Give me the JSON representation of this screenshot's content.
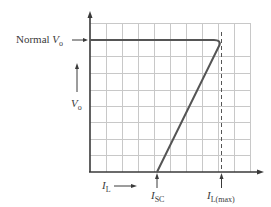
{
  "diagram": {
    "labels": {
      "normal_vo_prefix": "Normal ",
      "vo_symbol": "V",
      "vo_sub": "o",
      "il_symbol": "I",
      "il_sub": "L",
      "isc_symbol": "I",
      "isc_sub": "SC",
      "ilmax_symbol": "I",
      "ilmax_sub": "L(max)"
    },
    "axes": {
      "x": "I_L (load current)",
      "y": "V_o (output voltage)"
    },
    "curve": {
      "description": "Output voltage stays at Normal V_o as load current increases up to I_L(max), then folds back linearly to 0 V at I_SC",
      "points": [
        {
          "label": "start",
          "x": 0,
          "y": "Normal V_o"
        },
        {
          "label": "I_L(max)",
          "x": "I_L(max)",
          "y": "Normal V_o"
        },
        {
          "label": "I_SC",
          "x": "I_SC",
          "y": 0
        }
      ]
    },
    "colors": {
      "curve": "#555555",
      "grid": "#c8c8c8",
      "axis": "#3a3a3a",
      "dashed": "#555555"
    }
  }
}
